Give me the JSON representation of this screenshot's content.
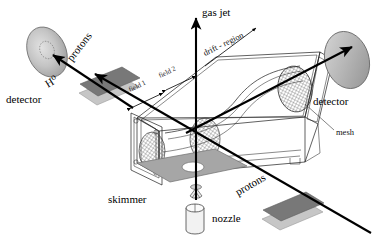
{
  "figure": {
    "width": 387,
    "height": 246,
    "background": "#ffffff"
  },
  "labels": {
    "gas_jet": "gas jet",
    "protons_upper": "protons",
    "protons_lower": "protons",
    "h_zero": "H⁰",
    "detector_left": "detector",
    "detector_right": "detector",
    "drift_region": "drift - region",
    "field_1": "field 1",
    "field_2": "field 2",
    "mesh": "mesh",
    "skimmer": "skimmer",
    "nozzle": "nozzle"
  },
  "colors": {
    "ink": "#1c1c1c",
    "plate_dark": "#7b7b7b",
    "plate_light": "#c9c9c9",
    "base_plate": "#a8a8a8",
    "detector_face": "#bdbdbd",
    "detector_edge": "#8e8e8e",
    "mesh_line": "#555555",
    "background": "#ffffff"
  },
  "components": [
    {
      "name": "left-detector-disk",
      "type": "disk",
      "label": "detector"
    },
    {
      "name": "right-detector-disk",
      "type": "disk",
      "label": "detector"
    },
    {
      "name": "left-field-plates",
      "type": "plate-pair",
      "label": "field 1"
    },
    {
      "name": "right-field-plates",
      "type": "plate-pair",
      "label": "field 2"
    },
    {
      "name": "drift-chamber",
      "type": "box",
      "label": "drift - region"
    },
    {
      "name": "mesh-grid",
      "type": "mesh-ellipse",
      "label": "mesh"
    },
    {
      "name": "base-plate",
      "type": "plate",
      "label": ""
    },
    {
      "name": "skimmer-cone",
      "type": "cone",
      "label": "skimmer"
    },
    {
      "name": "nozzle-cylinder",
      "type": "cylinder",
      "label": "nozzle"
    },
    {
      "name": "gas-jet-axis",
      "type": "arrow",
      "label": "gas jet"
    },
    {
      "name": "proton-beam",
      "type": "arrow",
      "label": "protons"
    },
    {
      "name": "h-zero-beam",
      "type": "arrow",
      "label": "H⁰"
    }
  ]
}
